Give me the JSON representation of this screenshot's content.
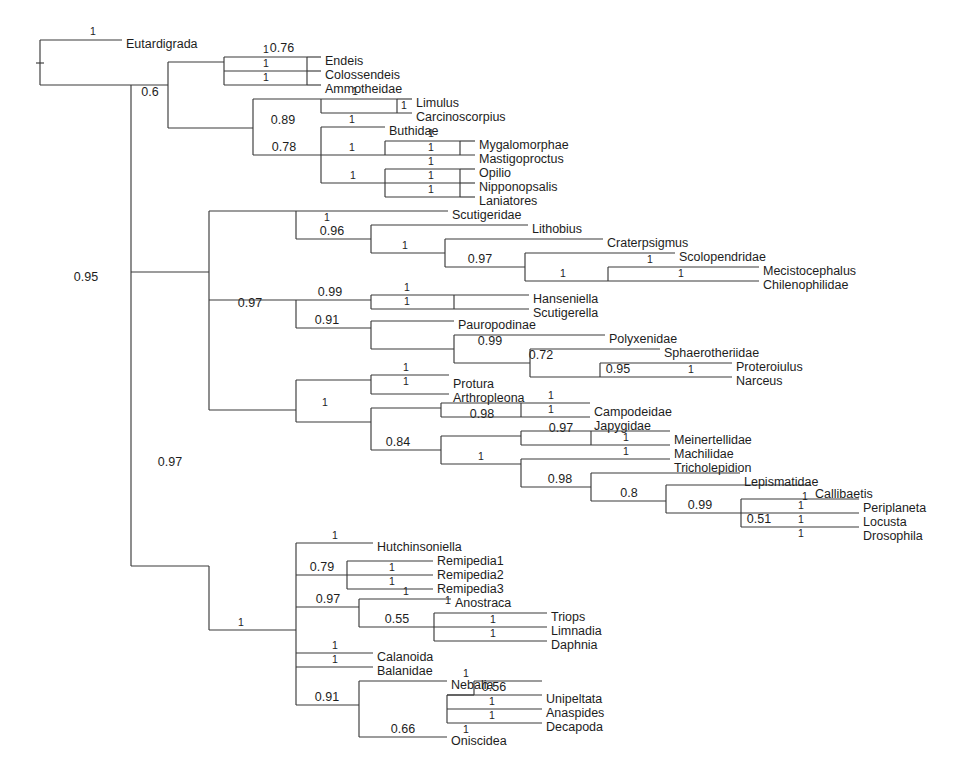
{
  "figure": {
    "type": "phylogenetic-tree",
    "background_color": "#ffffff",
    "line_color": "#3a3a3a",
    "text_color": "#1d1d1d"
  },
  "chart_data": {
    "type": "tree",
    "title": "",
    "xlabel": "",
    "ylabel": "",
    "taxa": [
      "Eutardigrada",
      "Endeis",
      "Colossendeis",
      "Ammotheidae",
      "Limulus",
      "Carcinoscorpius",
      "Buthidae",
      "Mygalomorphae",
      "Mastigoproctus",
      "Opilio",
      "Nipponopsalis",
      "Laniatores",
      "Scutigeridae",
      "Lithobius",
      "Craterpsigmus",
      "Scolopendridae",
      "Mecistocephalus",
      "Chilenophilidae",
      "Hanseniella",
      "Scutigerella",
      "Pauropodinae",
      "Polyxenidae",
      "Sphaerotheriidae",
      "Proteroiulus",
      "Narceus",
      "Protura",
      "Arthropleona",
      "Campodeidae",
      "Japygidae",
      "Meinertellidae",
      "Machilidae",
      "Tricholepidion",
      "Lepismatidae",
      "Callibaetis",
      "Periplaneta",
      "Locusta",
      "Drosophila",
      "Hutchinsoniella",
      "Remipedia1",
      "Remipedia2",
      "Remipedia3",
      "Anostraca",
      "Triops",
      "Limnadia",
      "Daphnia",
      "Calanoida",
      "Balanidae",
      "Nebalia",
      "Unipeltata",
      "Anaspides",
      "Decapoda",
      "Oniscidea"
    ],
    "support_values": [
      "1",
      "0.95",
      "0.6",
      "0.76",
      "1",
      "1",
      "0.89",
      "1",
      "1",
      "0.78",
      "1",
      "1",
      "1",
      "1",
      "1",
      "1",
      "0.97",
      "1",
      "0.96",
      "1",
      "0.97",
      "1",
      "0.99",
      "1",
      "1",
      "0.91",
      "1",
      "0.99",
      "0.72",
      "0.95",
      "1",
      "1",
      "1",
      "1",
      "0.98",
      "1",
      "0.84",
      "1",
      "0.97",
      "1",
      "1",
      "0.98",
      "0.8",
      "0.99",
      "0.51",
      "1",
      "1",
      "1",
      "1",
      "0.79",
      "1",
      "1",
      "0.97",
      "1",
      "0.55",
      "1",
      "1",
      "1",
      "1",
      "0.91",
      "1",
      "0.66",
      "0.56",
      "1",
      "1",
      "1"
    ]
  },
  "tips": [
    {
      "name": "Eutardigrada",
      "x": 123,
      "y": 45
    },
    {
      "name": "Endeis",
      "x": 322,
      "y": 62
    },
    {
      "name": "Colossendeis",
      "x": 322,
      "y": 76
    },
    {
      "name": "Ammotheidae",
      "x": 322,
      "y": 90
    },
    {
      "name": "Limulus",
      "x": 413,
      "y": 104
    },
    {
      "name": "Carcinoscorpius",
      "x": 413,
      "y": 118
    },
    {
      "name": "Buthidae",
      "x": 386,
      "y": 132
    },
    {
      "name": "Mygalomorphae",
      "x": 476,
      "y": 146
    },
    {
      "name": "Mastigoproctus",
      "x": 476,
      "y": 160
    },
    {
      "name": "Opilio",
      "x": 476,
      "y": 174
    },
    {
      "name": "Nipponopsalis",
      "x": 476,
      "y": 188
    },
    {
      "name": "Laniatores",
      "x": 476,
      "y": 202
    },
    {
      "name": "Scutigeridae",
      "x": 449,
      "y": 216
    },
    {
      "name": "Lithobius",
      "x": 529,
      "y": 230
    },
    {
      "name": "Craterpsigmus",
      "x": 604,
      "y": 244
    },
    {
      "name": "Scolopendridae",
      "x": 676,
      "y": 258
    },
    {
      "name": "Mecistocephalus",
      "x": 760,
      "y": 272
    },
    {
      "name": "Chilenophilidae",
      "x": 760,
      "y": 286
    },
    {
      "name": "Hanseniella",
      "x": 530,
      "y": 300
    },
    {
      "name": "Scutigerella",
      "x": 530,
      "y": 314
    },
    {
      "name": "Pauropodinae",
      "x": 455,
      "y": 326
    },
    {
      "name": "Polyxenidae",
      "x": 606,
      "y": 340
    },
    {
      "name": "Sphaerotheriidae",
      "x": 661,
      "y": 354
    },
    {
      "name": "Proteroiulus",
      "x": 733,
      "y": 368
    },
    {
      "name": "Narceus",
      "x": 733,
      "y": 382
    },
    {
      "name": "Protura",
      "x": 450,
      "y": 385
    },
    {
      "name": "Arthropleona",
      "x": 450,
      "y": 399
    },
    {
      "name": "Campodeidae",
      "x": 591,
      "y": 413
    },
    {
      "name": "Japygidae",
      "x": 591,
      "y": 427
    },
    {
      "name": "Meinertellidae",
      "x": 671,
      "y": 441
    },
    {
      "name": "Machilidae",
      "x": 671,
      "y": 455
    },
    {
      "name": "Tricholepidion",
      "x": 671,
      "y": 469
    },
    {
      "name": "Lepismatidae",
      "x": 741,
      "y": 483
    },
    {
      "name": "Callibaetis",
      "x": 812,
      "y": 495
    },
    {
      "name": "Periplaneta",
      "x": 860,
      "y": 509
    },
    {
      "name": "Locusta",
      "x": 860,
      "y": 523
    },
    {
      "name": "Drosophila",
      "x": 860,
      "y": 537
    },
    {
      "name": "Hutchinsoniella",
      "x": 374,
      "y": 548
    },
    {
      "name": "Remipedia1",
      "x": 434,
      "y": 562
    },
    {
      "name": "Remipedia2",
      "x": 434,
      "y": 576
    },
    {
      "name": "Remipedia3",
      "x": 434,
      "y": 590
    },
    {
      "name": "Anostraca",
      "x": 452,
      "y": 604
    },
    {
      "name": "Triops",
      "x": 548,
      "y": 618
    },
    {
      "name": "Limnadia",
      "x": 548,
      "y": 632
    },
    {
      "name": "Daphnia",
      "x": 548,
      "y": 646
    },
    {
      "name": "Calanoida",
      "x": 374,
      "y": 658
    },
    {
      "name": "Balanidae",
      "x": 374,
      "y": 672
    },
    {
      "name": "Nebalia",
      "x": 448,
      "y": 686
    },
    {
      "name": "Unipeltata",
      "x": 543,
      "y": 700
    },
    {
      "name": "Anaspides",
      "x": 543,
      "y": 714
    },
    {
      "name": "Decapoda",
      "x": 543,
      "y": 728
    },
    {
      "name": "Oniscidea",
      "x": 448,
      "y": 742
    }
  ],
  "branches": [
    {
      "d": "M 40 63 L 40 40"
    },
    {
      "d": "M 40 40 L 122 40"
    },
    {
      "d": "M 40 63 L 40 85"
    },
    {
      "d": "M 40 85 L 131 85"
    },
    {
      "d": "M 36 63 L 44 63"
    },
    {
      "d": "M 131 85 L 131 272"
    },
    {
      "d": "M 131 85 L 168 85"
    },
    {
      "d": "M 131 272 L 209 272"
    },
    {
      "d": "M 168 62 L 168 128"
    },
    {
      "d": "M 168 62 L 224 62"
    },
    {
      "d": "M 168 128 L 253 128"
    },
    {
      "d": "M 224 57 L 224 85"
    },
    {
      "d": "M 224 57 L 307 57"
    },
    {
      "d": "M 224 71 L 307 71"
    },
    {
      "d": "M 224 85 L 307 85"
    },
    {
      "d": "M 307 57 L 307 85"
    },
    {
      "d": "M 307 57 L 321 57"
    },
    {
      "d": "M 307 71 L 321 71"
    },
    {
      "d": "M 307 85 L 321 85"
    },
    {
      "d": "M 253 99 L 253 155"
    },
    {
      "d": "M 253 99 L 321 99"
    },
    {
      "d": "M 253 155 L 321 155"
    },
    {
      "d": "M 321 99 L 321 113"
    },
    {
      "d": "M 321 99 L 397 99"
    },
    {
      "d": "M 321 113 L 412 113"
    },
    {
      "d": "M 397 99 L 397 113"
    },
    {
      "d": "M 397 99 L 412 99"
    },
    {
      "d": "M 321 127 L 321 183"
    },
    {
      "d": "M 321 127 L 385 127"
    },
    {
      "d": "M 321 155 L 385 155"
    },
    {
      "d": "M 321 183 L 385 183"
    },
    {
      "d": "M 385 141 L 385 155"
    },
    {
      "d": "M 385 141 L 460 141"
    },
    {
      "d": "M 385 155 L 475 155"
    },
    {
      "d": "M 460 141 L 460 155"
    },
    {
      "d": "M 460 141 L 475 141"
    },
    {
      "d": "M 385 169 L 385 197"
    },
    {
      "d": "M 385 169 L 460 169"
    },
    {
      "d": "M 385 183 L 460 183"
    },
    {
      "d": "M 385 197 L 460 197"
    },
    {
      "d": "M 460 169 L 460 197"
    },
    {
      "d": "M 460 169 L 475 169"
    },
    {
      "d": "M 460 183 L 475 183"
    },
    {
      "d": "M 460 197 L 475 197"
    },
    {
      "d": "M 209 211 L 209 410"
    },
    {
      "d": "M 209 211 L 296 211"
    },
    {
      "d": "M 209 300 L 296 300"
    },
    {
      "d": "M 209 410 L 296 410"
    },
    {
      "d": "M 296 211 L 296 239"
    },
    {
      "d": "M 296 211 L 448 211"
    },
    {
      "d": "M 296 239 L 371 239"
    },
    {
      "d": "M 371 225 L 371 253"
    },
    {
      "d": "M 371 225 L 528 225"
    },
    {
      "d": "M 371 253 L 445 253"
    },
    {
      "d": "M 445 239 L 445 267"
    },
    {
      "d": "M 445 239 L 603 239"
    },
    {
      "d": "M 445 267 L 525 267"
    },
    {
      "d": "M 525 253 L 525 281"
    },
    {
      "d": "M 525 253 L 675 253"
    },
    {
      "d": "M 525 281 L 608 281"
    },
    {
      "d": "M 608 267 L 608 281"
    },
    {
      "d": "M 608 267 L 759 267"
    },
    {
      "d": "M 608 281 L 759 281"
    },
    {
      "d": "M 296 300 L 296 328"
    },
    {
      "d": "M 296 300 L 371 300"
    },
    {
      "d": "M 296 328 L 371 328"
    },
    {
      "d": "M 371 295 L 371 309"
    },
    {
      "d": "M 371 295 L 454 295"
    },
    {
      "d": "M 371 309 L 529 309"
    },
    {
      "d": "M 454 295 L 454 309"
    },
    {
      "d": "M 454 295 L 529 295"
    },
    {
      "d": "M 371 321 L 371 349"
    },
    {
      "d": "M 371 321 L 454 321"
    },
    {
      "d": "M 371 349 L 454 349"
    },
    {
      "d": "M 454 335 L 454 363"
    },
    {
      "d": "M 454 335 L 605 335"
    },
    {
      "d": "M 454 363 L 530 363"
    },
    {
      "d": "M 530 349 L 530 377"
    },
    {
      "d": "M 530 349 L 660 349"
    },
    {
      "d": "M 530 377 L 600 377"
    },
    {
      "d": "M 600 363 L 600 377"
    },
    {
      "d": "M 600 363 L 732 363"
    },
    {
      "d": "M 600 377 L 732 377"
    },
    {
      "d": "M 296 380 L 296 422"
    },
    {
      "d": "M 296 380 L 371 380"
    },
    {
      "d": "M 296 422 L 371 422"
    },
    {
      "d": "M 371 375 L 371 394"
    },
    {
      "d": "M 371 375 L 449 375"
    },
    {
      "d": "M 371 394 L 449 394"
    },
    {
      "d": "M 371 408 L 371 450"
    },
    {
      "d": "M 371 408 L 441 408"
    },
    {
      "d": "M 371 450 L 441 450"
    },
    {
      "d": "M 441 403 L 441 417"
    },
    {
      "d": "M 441 403 L 521 403"
    },
    {
      "d": "M 441 417 L 590 417"
    },
    {
      "d": "M 521 403 L 521 417"
    },
    {
      "d": "M 521 403 L 590 403"
    },
    {
      "d": "M 441 436 L 441 464"
    },
    {
      "d": "M 441 436 L 521 436"
    },
    {
      "d": "M 441 464 L 521 464"
    },
    {
      "d": "M 521 431 L 521 445"
    },
    {
      "d": "M 521 431 L 591 431"
    },
    {
      "d": "M 521 445 L 670 445"
    },
    {
      "d": "M 591 431 L 591 445"
    },
    {
      "d": "M 591 431 L 670 431"
    },
    {
      "d": "M 521 459 L 521 487"
    },
    {
      "d": "M 521 459 L 670 459"
    },
    {
      "d": "M 521 487 L 591 487"
    },
    {
      "d": "M 591 473 L 591 501"
    },
    {
      "d": "M 591 473 L 740 473"
    },
    {
      "d": "M 591 501 L 666 501"
    },
    {
      "d": "M 666 485 L 666 513"
    },
    {
      "d": "M 666 485 L 811 485"
    },
    {
      "d": "M 666 513 L 741 513"
    },
    {
      "d": "M 741 499 L 741 527"
    },
    {
      "d": "M 741 499 L 859 499"
    },
    {
      "d": "M 741 513 L 859 513"
    },
    {
      "d": "M 741 527 L 859 527"
    },
    {
      "d": "M 209 566 L 209 630"
    },
    {
      "d": "M 209 566 L 131 566"
    },
    {
      "d": "M 131 272 L 131 566"
    },
    {
      "d": "M 209 630 L 296 630"
    },
    {
      "d": "M 296 543 L 296 705"
    },
    {
      "d": "M 296 543 L 373 543"
    },
    {
      "d": "M 296 575 L 347 575"
    },
    {
      "d": "M 296 607 L 359 607"
    },
    {
      "d": "M 296 653 L 373 653"
    },
    {
      "d": "M 296 667 L 373 667"
    },
    {
      "d": "M 296 705 L 359 705"
    },
    {
      "d": "M 347 561 L 347 589"
    },
    {
      "d": "M 347 561 L 433 561"
    },
    {
      "d": "M 347 575 L 433 575"
    },
    {
      "d": "M 347 589 L 433 589"
    },
    {
      "d": "M 359 599 L 359 627"
    },
    {
      "d": "M 359 599 L 451 599"
    },
    {
      "d": "M 359 627 L 434 627"
    },
    {
      "d": "M 434 613 L 434 641"
    },
    {
      "d": "M 434 613 L 547 613"
    },
    {
      "d": "M 434 627 L 547 627"
    },
    {
      "d": "M 434 641 L 547 641"
    },
    {
      "d": "M 359 681 L 359 737"
    },
    {
      "d": "M 359 681 L 447 681"
    },
    {
      "d": "M 359 737 L 447 737"
    },
    {
      "d": "M 447 695 L 447 723"
    },
    {
      "d": "M 447 695 L 542 695"
    },
    {
      "d": "M 447 709 L 542 709"
    },
    {
      "d": "M 447 723 L 542 723"
    },
    {
      "d": "M 447 695 L 474 695"
    },
    {
      "d": "M 474 681 L 474 695"
    },
    {
      "d": "M 474 681 L 542 681"
    }
  ],
  "supports": [
    {
      "v": "1",
      "x": 93,
      "y": 35
    },
    {
      "v": "0.95",
      "x": 86,
      "y": 281
    },
    {
      "v": "0.6",
      "x": 150,
      "y": 96
    },
    {
      "v": "0.97",
      "x": 170,
      "y": 466
    },
    {
      "v": "0.76",
      "x": 282,
      "y": 52
    },
    {
      "v": "0.89",
      "x": 283,
      "y": 124
    },
    {
      "v": "1",
      "x": 266,
      "y": 53
    },
    {
      "v": "1",
      "x": 266,
      "y": 67
    },
    {
      "v": "1",
      "x": 266,
      "y": 81
    },
    {
      "v": "1",
      "x": 355,
      "y": 95
    },
    {
      "v": "1",
      "x": 404,
      "y": 109
    },
    {
      "v": "0.78",
      "x": 284,
      "y": 151
    },
    {
      "v": "1",
      "x": 352,
      "y": 123
    },
    {
      "v": "1",
      "x": 352,
      "y": 151
    },
    {
      "v": "1",
      "x": 353,
      "y": 179
    },
    {
      "v": "1",
      "x": 431,
      "y": 137
    },
    {
      "v": "1",
      "x": 431,
      "y": 151
    },
    {
      "v": "1",
      "x": 431,
      "y": 165
    },
    {
      "v": "1",
      "x": 431,
      "y": 179
    },
    {
      "v": "1",
      "x": 431,
      "y": 193
    },
    {
      "v": "0.97",
      "x": 250,
      "y": 307
    },
    {
      "v": "1",
      "x": 327,
      "y": 221
    },
    {
      "v": "0.96",
      "x": 332,
      "y": 235
    },
    {
      "v": "1",
      "x": 405,
      "y": 249
    },
    {
      "v": "0.97",
      "x": 480,
      "y": 263
    },
    {
      "v": "1",
      "x": 563,
      "y": 277
    },
    {
      "v": "1",
      "x": 650,
      "y": 263
    },
    {
      "v": "1",
      "x": 681,
      "y": 277
    },
    {
      "v": "0.99",
      "x": 330,
      "y": 296
    },
    {
      "v": "1",
      "x": 407,
      "y": 291
    },
    {
      "v": "1",
      "x": 407,
      "y": 305
    },
    {
      "v": "0.91",
      "x": 327,
      "y": 324
    },
    {
      "v": "0.99",
      "x": 490,
      "y": 345
    },
    {
      "v": "0.72",
      "x": 541,
      "y": 359
    },
    {
      "v": "0.95",
      "x": 618,
      "y": 373
    },
    {
      "v": "1",
      "x": 691,
      "y": 373
    },
    {
      "v": "1",
      "x": 325,
      "y": 406
    },
    {
      "v": "1",
      "x": 406,
      "y": 371
    },
    {
      "v": "1",
      "x": 406,
      "y": 385
    },
    {
      "v": "0.84",
      "x": 398,
      "y": 446
    },
    {
      "v": "0.98",
      "x": 482,
      "y": 418
    },
    {
      "v": "1",
      "x": 551,
      "y": 399
    },
    {
      "v": "1",
      "x": 551,
      "y": 413
    },
    {
      "v": "1",
      "x": 481,
      "y": 460
    },
    {
      "v": "0.97",
      "x": 561,
      "y": 432
    },
    {
      "v": "1",
      "x": 626,
      "y": 441
    },
    {
      "v": "1",
      "x": 626,
      "y": 455
    },
    {
      "v": "0.98",
      "x": 560,
      "y": 483
    },
    {
      "v": "0.8",
      "x": 629,
      "y": 497
    },
    {
      "v": "0.99",
      "x": 700,
      "y": 509
    },
    {
      "v": "0.51",
      "x": 759,
      "y": 523
    },
    {
      "v": "1",
      "x": 805,
      "y": 500
    },
    {
      "v": "1",
      "x": 801,
      "y": 509
    },
    {
      "v": "1",
      "x": 801,
      "y": 523
    },
    {
      "v": "1",
      "x": 801,
      "y": 537
    },
    {
      "v": "1",
      "x": 241,
      "y": 626
    },
    {
      "v": "1",
      "x": 335,
      "y": 539
    },
    {
      "v": "0.79",
      "x": 322,
      "y": 571
    },
    {
      "v": "1",
      "x": 392,
      "y": 571
    },
    {
      "v": "1",
      "x": 392,
      "y": 585
    },
    {
      "v": "0.97",
      "x": 328,
      "y": 603
    },
    {
      "v": "1",
      "x": 406,
      "y": 595
    },
    {
      "v": "0.55",
      "x": 397,
      "y": 623
    },
    {
      "v": "1",
      "x": 448,
      "y": 604
    },
    {
      "v": "1",
      "x": 493,
      "y": 623
    },
    {
      "v": "1",
      "x": 493,
      "y": 637
    },
    {
      "v": "1",
      "x": 335,
      "y": 649
    },
    {
      "v": "1",
      "x": 335,
      "y": 663
    },
    {
      "v": "0.91",
      "x": 327,
      "y": 701
    },
    {
      "v": "0.66",
      "x": 403,
      "y": 733
    },
    {
      "v": "0.56",
      "x": 494,
      "y": 691
    },
    {
      "v": "1",
      "x": 466,
      "y": 677
    },
    {
      "v": "1",
      "x": 492,
      "y": 705
    },
    {
      "v": "1",
      "x": 492,
      "y": 719
    },
    {
      "v": "1",
      "x": 466,
      "y": 733
    }
  ]
}
